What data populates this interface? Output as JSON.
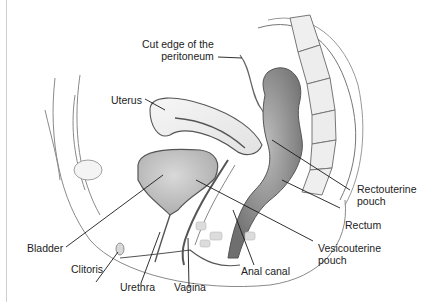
{
  "diagram": {
    "labels": {
      "cut_edge_line1": "Cut edge of the",
      "cut_edge_line2": "peritoneum",
      "uterus": "Uterus",
      "rectouterine_line1": "Rectouterine",
      "rectouterine_line2": "pouch",
      "rectum": "Rectum",
      "vesicouterine_line1": "Vesicouterine",
      "vesicouterine_line2": "pouch",
      "bladder": "Bladder",
      "clitoris": "Clitoris",
      "urethra": "Urethra",
      "vagina": "Vagina",
      "anal_canal": "Anal canal"
    },
    "colors": {
      "background": "#ffffff",
      "outline": "#555555",
      "leader": "#1a1a1a",
      "tissue_light": "#e6e6e6",
      "tissue_mid": "#b8b8b8",
      "tissue_dark": "#7a7a7a",
      "label_text": "#222222"
    }
  }
}
